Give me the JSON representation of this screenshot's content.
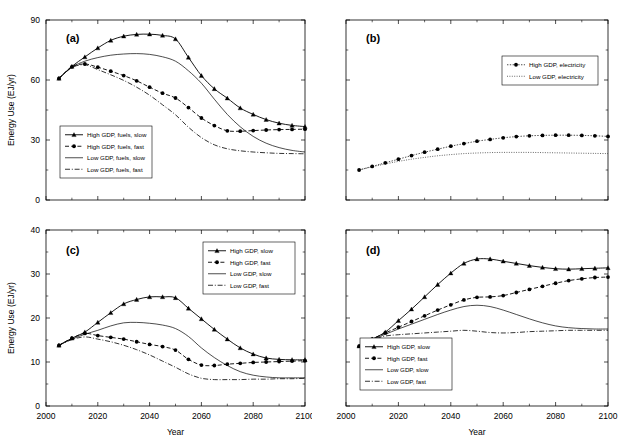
{
  "figure": {
    "background": "#ffffff",
    "line_color": "#000000",
    "panels": [
      "a",
      "b",
      "c",
      "d"
    ]
  },
  "axis": {
    "xlabel": "Year",
    "ylabel": "Energy Use (EJ/yr)",
    "xticks": [
      "2000",
      "2020",
      "2040",
      "2060",
      "2080",
      "2100"
    ],
    "yticks_top": [
      "0",
      "30",
      "60",
      "90"
    ],
    "yticks_bottom": [
      "0",
      "10",
      "20",
      "30",
      "40"
    ]
  },
  "labels": {
    "a": "(a)",
    "b": "(b)",
    "c": "(c)",
    "d": "(d)"
  },
  "chart_data": [
    {
      "id": "a",
      "type": "line",
      "title": "(a)",
      "xlabel": "Year",
      "ylabel": "Energy Use (EJ/yr)",
      "xlim": [
        2000,
        2100
      ],
      "ylim": [
        0,
        90
      ],
      "xticks": [
        2000,
        2020,
        2040,
        2060,
        2080,
        2100
      ],
      "yticks": [
        0,
        30,
        60,
        90
      ],
      "xticklabels_shown": false,
      "yticklabels_shown": true,
      "grid": false,
      "legend_position": "lower-left",
      "x": [
        2005,
        2010,
        2015,
        2020,
        2025,
        2030,
        2035,
        2040,
        2045,
        2050,
        2055,
        2060,
        2065,
        2070,
        2075,
        2080,
        2085,
        2090,
        2095,
        2100
      ],
      "series": [
        {
          "name": "High GDP, fuels, slow",
          "style": "solid-triangle",
          "marker": "triangle",
          "values": [
            60.8,
            66.8,
            71.5,
            76.0,
            79.8,
            81.9,
            82.8,
            82.9,
            82.3,
            80.5,
            71.3,
            62.2,
            55.6,
            50.9,
            46.0,
            42.8,
            40.2,
            38.4,
            37.3,
            36.7
          ]
        },
        {
          "name": "High GDP, fuels, fast",
          "style": "dashed-circle",
          "marker": "circle",
          "values": [
            60.8,
            66.6,
            68.0,
            66.4,
            64.4,
            62.2,
            59.6,
            56.4,
            53.4,
            51.0,
            46.2,
            41.0,
            37.2,
            34.6,
            34.4,
            34.7,
            35.0,
            35.2,
            35.3,
            35.4
          ]
        },
        {
          "name": "Low GDP, fuels, slow",
          "style": "thin-solid",
          "marker": "none",
          "values": [
            60.8,
            66.4,
            69.4,
            71.2,
            72.4,
            73.0,
            73.2,
            72.8,
            71.6,
            69.4,
            64.6,
            58.4,
            50.4,
            42.8,
            36.6,
            31.8,
            28.4,
            26.2,
            24.8,
            24.0
          ]
        },
        {
          "name": "Low GDP, fuels, fast",
          "style": "dash-dot",
          "marker": "none",
          "values": [
            60.8,
            66.2,
            67.6,
            65.2,
            62.6,
            59.8,
            56.4,
            52.4,
            47.6,
            42.6,
            36.4,
            31.2,
            27.6,
            25.6,
            24.6,
            24.0,
            23.6,
            23.3,
            23.2,
            23.1
          ]
        }
      ]
    },
    {
      "id": "b",
      "type": "line",
      "title": "(b)",
      "xlabel": "Year",
      "ylabel": "Energy Use (EJ/yr)",
      "xlim": [
        2000,
        2100
      ],
      "ylim": [
        0,
        90
      ],
      "xticks": [
        2000,
        2020,
        2040,
        2060,
        2080,
        2100
      ],
      "yticks": [
        0,
        30,
        60,
        90
      ],
      "xticklabels_shown": false,
      "yticklabels_shown": false,
      "grid": false,
      "legend_position": "upper-right",
      "x": [
        2005,
        2010,
        2015,
        2020,
        2025,
        2030,
        2035,
        2040,
        2045,
        2050,
        2055,
        2060,
        2065,
        2070,
        2075,
        2080,
        2085,
        2090,
        2095,
        2100
      ],
      "series": [
        {
          "name": "High GDP, electricity",
          "style": "dotted-circle",
          "marker": "circle",
          "values": [
            15.0,
            16.8,
            18.6,
            20.4,
            22.2,
            23.9,
            25.4,
            26.9,
            28.2,
            29.4,
            30.3,
            31.1,
            31.7,
            32.1,
            32.3,
            32.4,
            32.4,
            32.3,
            32.1,
            31.8
          ]
        },
        {
          "name": "Low GDP, electricity",
          "style": "fine-dotted",
          "marker": "none",
          "values": [
            15.0,
            16.6,
            18.0,
            19.3,
            20.4,
            21.3,
            22.1,
            22.7,
            23.2,
            23.5,
            23.7,
            23.8,
            23.8,
            23.8,
            23.7,
            23.6,
            23.5,
            23.4,
            23.3,
            23.2
          ]
        }
      ]
    },
    {
      "id": "c",
      "type": "line",
      "title": "(c)",
      "xlabel": "Year",
      "ylabel": "Energy Use (EJ/yr)",
      "xlim": [
        2000,
        2100
      ],
      "ylim": [
        0,
        40
      ],
      "xticks": [
        2000,
        2020,
        2040,
        2060,
        2080,
        2100
      ],
      "yticks": [
        0,
        10,
        20,
        30,
        40
      ],
      "xticklabels_shown": true,
      "yticklabels_shown": true,
      "grid": false,
      "legend_position": "upper-right",
      "x": [
        2005,
        2010,
        2015,
        2020,
        2025,
        2030,
        2035,
        2040,
        2045,
        2050,
        2055,
        2060,
        2065,
        2070,
        2075,
        2080,
        2085,
        2090,
        2095,
        2100
      ],
      "series": [
        {
          "name": "High GDP, slow",
          "style": "solid-triangle",
          "marker": "triangle",
          "values": [
            13.8,
            15.4,
            16.8,
            19.0,
            21.2,
            23.2,
            24.2,
            24.8,
            24.8,
            24.6,
            22.2,
            19.8,
            17.4,
            15.2,
            13.2,
            11.8,
            10.9,
            10.6,
            10.5,
            10.5
          ]
        },
        {
          "name": "High GDP, fast",
          "style": "dashed-circle",
          "marker": "circle",
          "values": [
            13.8,
            15.4,
            16.5,
            16.0,
            15.6,
            15.2,
            14.6,
            14.0,
            13.5,
            12.7,
            10.6,
            9.3,
            9.2,
            9.5,
            9.7,
            9.9,
            10.0,
            10.1,
            10.2,
            10.3
          ]
        },
        {
          "name": "Low GDP, slow",
          "style": "thin-solid",
          "marker": "none",
          "values": [
            13.8,
            15.2,
            16.3,
            17.2,
            18.2,
            18.9,
            19.0,
            18.8,
            18.4,
            17.6,
            15.8,
            13.2,
            11.0,
            9.2,
            7.8,
            7.0,
            6.6,
            6.4,
            6.4,
            6.4
          ]
        },
        {
          "name": "Low GDP, fast",
          "style": "dash-dot",
          "marker": "none",
          "values": [
            13.8,
            15.1,
            15.7,
            15.2,
            14.6,
            13.8,
            12.8,
            11.6,
            10.2,
            8.8,
            7.3,
            6.3,
            6.0,
            6.0,
            6.0,
            6.1,
            6.1,
            6.2,
            6.2,
            6.3
          ]
        }
      ]
    },
    {
      "id": "d",
      "type": "line",
      "title": "(d)",
      "xlabel": "Year",
      "ylabel": "Energy Use (EJ/yr)",
      "xlim": [
        2000,
        2100
      ],
      "ylim": [
        0,
        40
      ],
      "xticks": [
        2000,
        2020,
        2040,
        2060,
        2080,
        2100
      ],
      "yticks": [
        0,
        10,
        20,
        30,
        40
      ],
      "xticklabels_shown": true,
      "yticklabels_shown": false,
      "grid": false,
      "legend_position": "lower-left",
      "x": [
        2005,
        2010,
        2015,
        2020,
        2025,
        2030,
        2035,
        2040,
        2045,
        2050,
        2055,
        2060,
        2065,
        2070,
        2075,
        2080,
        2085,
        2090,
        2095,
        2100
      ],
      "series": [
        {
          "name": "High GDP, slow",
          "style": "solid-triangle",
          "marker": "triangle",
          "values": [
            13.6,
            15.2,
            16.8,
            19.4,
            22.0,
            24.8,
            27.6,
            30.2,
            32.4,
            33.4,
            33.4,
            32.9,
            32.4,
            31.9,
            31.5,
            31.2,
            31.1,
            31.2,
            31.3,
            31.4
          ]
        },
        {
          "name": "High GDP, fast",
          "style": "dashed-circle",
          "marker": "circle",
          "values": [
            13.6,
            15.2,
            16.6,
            17.9,
            19.2,
            20.5,
            21.8,
            23.0,
            24.1,
            24.7,
            24.8,
            25.1,
            25.8,
            26.5,
            27.2,
            27.9,
            28.5,
            28.9,
            29.2,
            29.3
          ]
        },
        {
          "name": "Low GDP, slow",
          "style": "thin-solid",
          "marker": "none",
          "values": [
            13.6,
            15.1,
            16.3,
            17.5,
            18.6,
            19.7,
            20.8,
            21.8,
            22.6,
            22.9,
            22.6,
            21.8,
            20.8,
            19.8,
            18.9,
            18.2,
            17.8,
            17.6,
            17.5,
            17.5
          ]
        },
        {
          "name": "Low GDP, fast",
          "style": "dash-dot",
          "marker": "none",
          "values": [
            13.6,
            15.0,
            15.9,
            16.2,
            16.4,
            16.6,
            16.8,
            17.0,
            17.2,
            17.0,
            16.7,
            16.6,
            16.7,
            16.9,
            17.0,
            17.1,
            17.2,
            17.2,
            17.2,
            17.2
          ]
        }
      ]
    }
  ]
}
